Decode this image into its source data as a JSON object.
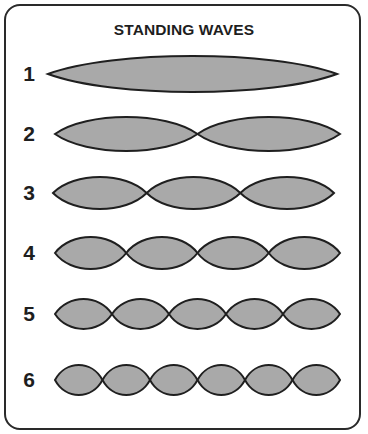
{
  "title": "STANDING WAVES",
  "colors": {
    "fill": "#a9a9a9",
    "stroke": "#1f1f1f",
    "border": "#2a2a2a",
    "text": "#1e1e1e"
  },
  "waves": [
    {
      "label": "1",
      "loops": 1,
      "cy": 74,
      "x0": 48,
      "x1": 337,
      "amp": 18,
      "label_y": 62
    },
    {
      "label": "2",
      "loops": 2,
      "cy": 134,
      "x0": 55,
      "x1": 340,
      "amp": 17,
      "label_y": 122
    },
    {
      "label": "3",
      "loops": 3,
      "cy": 193,
      "x0": 53,
      "x1": 334,
      "amp": 16,
      "label_y": 181
    },
    {
      "label": "4",
      "loops": 4,
      "cy": 253,
      "x0": 55,
      "x1": 340,
      "amp": 16,
      "label_y": 241
    },
    {
      "label": "5",
      "loops": 5,
      "cy": 314,
      "x0": 55,
      "x1": 340,
      "amp": 15,
      "label_y": 302
    },
    {
      "label": "6",
      "loops": 6,
      "cy": 380,
      "x0": 55,
      "x1": 340,
      "amp": 15,
      "label_y": 368
    }
  ]
}
